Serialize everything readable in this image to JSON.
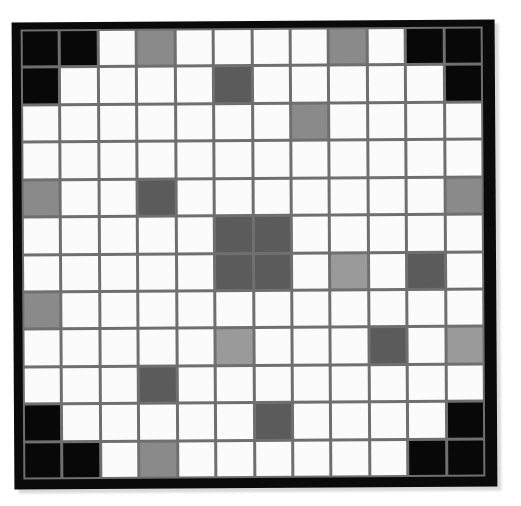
{
  "figure": {
    "rows": 12,
    "columns": 12,
    "frame_color": "#0a0a0a",
    "gridline_color": "#6f6f6f",
    "background_color": "#ffffff"
  },
  "palette": {
    "white": "#fbfbfb",
    "light": "#9a9a9a",
    "gray": "#8a8a8a",
    "dark": "#5b5b5b",
    "black": "#080808"
  },
  "legend": [
    {
      "key": "white",
      "label": "white",
      "hex": "#fbfbfb"
    },
    {
      "key": "light",
      "label": "light gray",
      "hex": "#9a9a9a"
    },
    {
      "key": "gray",
      "label": "medium gray",
      "hex": "#8a8a8a"
    },
    {
      "key": "dark",
      "label": "dark gray",
      "hex": "#5b5b5b"
    },
    {
      "key": "black",
      "label": "black",
      "hex": "#080808"
    }
  ],
  "chart_data": {
    "type": "heatmap",
    "xlabel": "",
    "ylabel": "",
    "categories_x": [
      "1",
      "2",
      "3",
      "4",
      "5",
      "6",
      "7",
      "8",
      "9",
      "10",
      "11",
      "12"
    ],
    "categories_y": [
      "1",
      "2",
      "3",
      "4",
      "5",
      "6",
      "7",
      "8",
      "9",
      "10",
      "11",
      "12"
    ],
    "value_scale": {
      "white": 0,
      "light": 1,
      "gray": 2,
      "dark": 3,
      "black": 4
    },
    "cells": [
      [
        "black",
        "black",
        "white",
        "gray",
        "white",
        "white",
        "white",
        "white",
        "gray",
        "white",
        "black",
        "black"
      ],
      [
        "black",
        "white",
        "white",
        "white",
        "white",
        "dark",
        "white",
        "white",
        "white",
        "white",
        "white",
        "black"
      ],
      [
        "white",
        "white",
        "white",
        "white",
        "white",
        "white",
        "white",
        "gray",
        "white",
        "white",
        "white",
        "white"
      ],
      [
        "white",
        "white",
        "white",
        "white",
        "white",
        "white",
        "white",
        "white",
        "white",
        "white",
        "white",
        "white"
      ],
      [
        "gray",
        "white",
        "white",
        "dark",
        "white",
        "white",
        "white",
        "white",
        "white",
        "white",
        "white",
        "gray"
      ],
      [
        "white",
        "white",
        "white",
        "white",
        "white",
        "dark",
        "dark",
        "white",
        "white",
        "white",
        "white",
        "white"
      ],
      [
        "white",
        "white",
        "white",
        "white",
        "white",
        "dark",
        "dark",
        "white",
        "light",
        "white",
        "dark",
        "white"
      ],
      [
        "gray",
        "white",
        "white",
        "white",
        "white",
        "white",
        "white",
        "white",
        "white",
        "white",
        "white",
        "white"
      ],
      [
        "white",
        "white",
        "white",
        "white",
        "white",
        "light",
        "white",
        "white",
        "white",
        "dark",
        "white",
        "light"
      ],
      [
        "white",
        "white",
        "white",
        "dark",
        "white",
        "white",
        "white",
        "white",
        "white",
        "white",
        "white",
        "white"
      ],
      [
        "black",
        "white",
        "white",
        "white",
        "white",
        "white",
        "dark",
        "white",
        "white",
        "white",
        "white",
        "black"
      ],
      [
        "black",
        "black",
        "white",
        "gray",
        "white",
        "white",
        "white",
        "white",
        "white",
        "white",
        "black",
        "black"
      ]
    ]
  },
  "caption": {
    "text": ""
  }
}
